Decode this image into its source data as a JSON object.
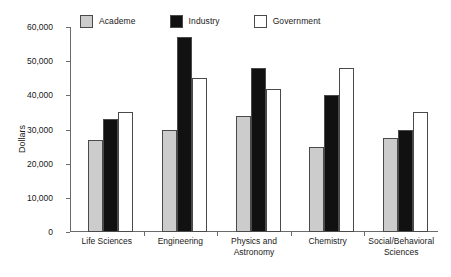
{
  "chart_data": {
    "type": "bar",
    "title": "",
    "subtitle": "",
    "xlabel": "",
    "ylabel": "Dollars",
    "ylim": [
      0,
      60000
    ],
    "ytick_values": [
      0,
      10000,
      20000,
      30000,
      40000,
      50000,
      60000
    ],
    "ytick_labels": [
      "0",
      "10,000",
      "20,000",
      "30,000",
      "40,000",
      "50,000",
      "60,000"
    ],
    "grid": false,
    "legend_position": "top",
    "categories": [
      "Life Sciences",
      "Engineering",
      "Physics and\nAstronomy",
      "Chemistry",
      "Social/Behavioral\nSciences"
    ],
    "series": [
      {
        "name": "Academe",
        "color": "#cccccc",
        "values": [
          27000,
          30000,
          34000,
          25000,
          27500
        ]
      },
      {
        "name": "Industry",
        "color": "#111111",
        "values": [
          33000,
          57000,
          48000,
          40000,
          30000
        ]
      },
      {
        "name": "Government",
        "color": "#ffffff",
        "values": [
          35000,
          45000,
          42000,
          48000,
          35000
        ]
      }
    ]
  },
  "legend": {
    "entries": [
      {
        "label": "Academe",
        "color": "#cccccc"
      },
      {
        "label": "Industry",
        "color": "#111111"
      },
      {
        "label": "Government",
        "color": "#ffffff"
      }
    ]
  },
  "axes": {
    "y_title": "Dollars"
  },
  "colors": {
    "academe": "#cccccc",
    "industry": "#111111",
    "government": "#ffffff",
    "axis": "#6b6b6b",
    "bar_outline": "#4a4a4a",
    "text": "#1a1a1a",
    "background": "#ffffff"
  }
}
